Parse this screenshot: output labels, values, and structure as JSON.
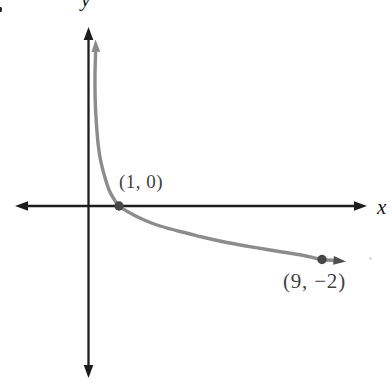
{
  "chart_data": {
    "type": "line",
    "title": "",
    "xlabel": "x",
    "ylabel": "y",
    "axes": {
      "ticks": "none",
      "gridlines": false,
      "axis_arrows": "both ends of x-axis and y-axis",
      "xlim_shown": [
        -3.3,
        11.4
      ],
      "ylim_shown": [
        -6.6,
        7.7
      ]
    },
    "labeled_points": [
      {
        "x": 1,
        "y": 0,
        "label": "(1, 0)"
      },
      {
        "x": 9,
        "y": -2,
        "label": "(9, −2)"
      }
    ],
    "series": [
      {
        "name": "decreasing logarithmic curve (y = -log base 3 of x), vertical asymptote x = 0, arrowheads on both ends",
        "points": [
          [
            0.04,
            2.93
          ],
          [
            0.08,
            2.3
          ],
          [
            0.15,
            1.73
          ],
          [
            0.3,
            1.1
          ],
          [
            0.5,
            0.63
          ],
          [
            0.75,
            0.26
          ],
          [
            1,
            0
          ],
          [
            1.5,
            -0.37
          ],
          [
            2,
            -0.63
          ],
          [
            3,
            -1
          ],
          [
            4,
            -1.26
          ],
          [
            5,
            -1.46
          ],
          [
            6,
            -1.63
          ],
          [
            7,
            -1.77
          ],
          [
            8,
            -1.89
          ],
          [
            9,
            -2
          ]
        ]
      }
    ],
    "legend": "none"
  },
  "render": {
    "colors": {
      "axis": "#1d1d1d",
      "curve": "#8c8c8c",
      "curve_arrow_start": "#8a8a8a",
      "curve_arrow_end": "#4f4f4f",
      "dot": "#474747",
      "speck": "#d9d9d9"
    },
    "axis_stroke": 2.3,
    "axis_arrow": {
      "len": 13,
      "half_width": 4.8
    },
    "x_axis": {
      "y": 206,
      "tip_left": 15,
      "tip_right": 367
    },
    "y_axis": {
      "x": 88.5,
      "tip_top": 27,
      "tip_bottom": 378
    },
    "curve": {
      "stroke": 3.4,
      "arrow_len": 12.5,
      "arrow_half_width": 4.4,
      "arrow_start": {
        "tip": [
          95.5,
          39.5
        ],
        "angle": -92
      },
      "arrow_end": {
        "tip": [
          346,
          261.5
        ],
        "angle": 5
      },
      "points_px": [
        [
          95.6,
          52
        ],
        [
          95.0,
          75
        ],
        [
          95.2,
          100
        ],
        [
          96.3,
          122
        ],
        [
          98.0,
          143
        ],
        [
          100.5,
          160
        ],
        [
          104.5,
          176
        ],
        [
          109.5,
          191
        ],
        [
          114.0,
          199
        ],
        [
          119.0,
          206
        ],
        [
          131,
          213.5
        ],
        [
          143,
          219.5
        ],
        [
          160,
          226
        ],
        [
          180,
          231.5
        ],
        [
          200,
          236.5
        ],
        [
          222,
          241.5
        ],
        [
          246,
          246
        ],
        [
          270,
          250
        ],
        [
          295,
          254
        ],
        [
          310,
          256.8
        ],
        [
          322,
          259.5
        ],
        [
          335,
          260.5
        ]
      ]
    },
    "dots": [
      {
        "cx": 119,
        "cy": 206,
        "r": 4.7
      },
      {
        "cx": 322,
        "cy": 259.5,
        "r": 4.7
      }
    ],
    "speck": {
      "cx": 370.5,
      "cy": 258.5,
      "r": 1.4
    }
  }
}
